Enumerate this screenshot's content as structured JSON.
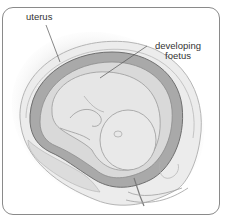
{
  "figure": {
    "labels": [
      {
        "id": "uterus",
        "text": "uterus"
      },
      {
        "id": "foetus",
        "text_line1": "developing",
        "text_line2": "foetus"
      }
    ],
    "colors": {
      "frame": "#8a8a8a",
      "uterus_wall": "#a9a9a9",
      "amniotic": "#d9d9d9",
      "foetus": "#e4e4e4",
      "outline": "#6f6f6f",
      "label_text": "#333333"
    }
  }
}
